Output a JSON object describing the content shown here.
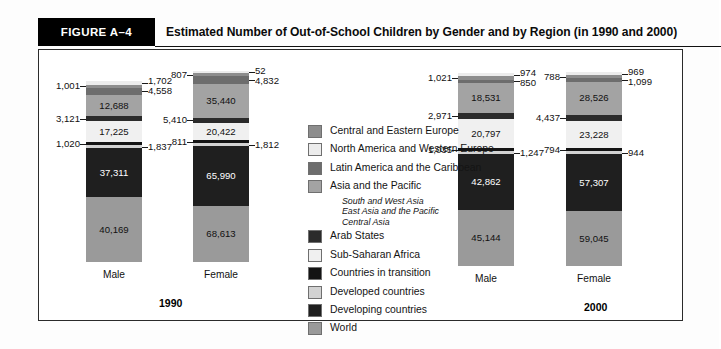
{
  "header": {
    "figure_tag": "FIGURE A–4",
    "title": "Estimated Number of Out-of-School Children by Gender and by Region (in 1990 and 2000)"
  },
  "legend": {
    "items": [
      {
        "label": "Central and Eastern Europe",
        "color": "#8d8d8d"
      },
      {
        "label": "North America and Western Europe",
        "color": "#ececec"
      },
      {
        "label": "Latin America and the Caribbean",
        "color": "#6d6d6d"
      },
      {
        "label": "Asia and the Pacific",
        "color": "#a3a3a3",
        "sub": [
          "South and West Asia",
          "East Asia and the Pacific",
          "Central Asia"
        ]
      },
      {
        "label": "Arab States",
        "color": "#2b2b2b"
      },
      {
        "label": "Sub-Saharan Africa",
        "color": "#f0f0f0"
      },
      {
        "label": "Countries in transition",
        "color": "#141414"
      },
      {
        "label": "Developed countries",
        "color": "#d2d2d2"
      },
      {
        "label": "Developing countries",
        "color": "#1f1f1f"
      },
      {
        "label": "World",
        "color": "#9a9a9a"
      }
    ]
  },
  "groups": [
    {
      "year": "1990",
      "bars": [
        {
          "gender": "Male"
        },
        {
          "gender": "Female"
        }
      ]
    },
    {
      "year": "2000",
      "bars": [
        {
          "gender": "Male"
        },
        {
          "gender": "Female"
        }
      ]
    }
  ],
  "chart_data": {
    "type": "bar",
    "title": "Estimated Number of Out-of-School Children by Gender and by Region (in 1990 and 2000)",
    "subtitle": "",
    "xlabel": "",
    "ylabel": "Number of out-of-school children (thousands)",
    "stacked": true,
    "grid": false,
    "legend_position": "center",
    "units": "thousands",
    "categories": [
      "1990 Male",
      "1990 Female",
      "2000 Male",
      "2000 Female"
    ],
    "series": [
      {
        "name": "Central and Eastern Europe",
        "color": "#8d8d8d",
        "values": [
          1001,
          807,
          1021,
          788
        ]
      },
      {
        "name": "North America and Western Europe",
        "color": "#ececec",
        "values": [
          1702,
          52,
          974,
          969
        ]
      },
      {
        "name": "Latin America and the Caribbean",
        "color": "#6d6d6d",
        "values": [
          4558,
          4832,
          850,
          1099
        ]
      },
      {
        "name": "Asia and the Pacific",
        "color": "#a3a3a3",
        "values": [
          12688,
          35440,
          18531,
          28526
        ]
      },
      {
        "name": "Arab States",
        "color": "#2b2b2b",
        "values": [
          3121,
          5410,
          2971,
          4437
        ]
      },
      {
        "name": "Sub-Saharan Africa",
        "color": "#f0f0f0",
        "values": [
          17225,
          20422,
          20797,
          23228
        ]
      },
      {
        "name": "Countries in transition",
        "color": "#141414",
        "values": [
          1020,
          811,
          1035,
          794
        ]
      },
      {
        "name": "Developed countries",
        "color": "#d2d2d2",
        "values": [
          1837,
          1812,
          1247,
          944
        ]
      },
      {
        "name": "Developing countries",
        "color": "#1f1f1f",
        "values": [
          37311,
          65990,
          42862,
          57307
        ]
      },
      {
        "name": "World",
        "color": "#9a9a9a",
        "values": [
          40169,
          68613,
          45144,
          59045
        ]
      }
    ],
    "bars": [
      {
        "group": "1990",
        "gender": "Male",
        "segments": [
          {
            "name": "North America and Western Europe",
            "value": "1,702",
            "color": "#ececec",
            "side": "right"
          },
          {
            "name": "Central and Eastern Europe",
            "value": "1,001",
            "color": "#8d8d8d",
            "side": "left"
          },
          {
            "name": "Latin America and the Caribbean",
            "value": "4,558",
            "color": "#6d6d6d",
            "side": "right"
          },
          {
            "name": "Asia and the Pacific",
            "value": "12,688",
            "color": "#a3a3a3",
            "side": "in-dark"
          },
          {
            "name": "Arab States",
            "value": "3,121",
            "color": "#2b2b2b",
            "side": "left"
          },
          {
            "name": "Sub-Saharan Africa",
            "value": "17,225",
            "color": "#f0f0f0",
            "side": "in-dark"
          },
          {
            "name": "Countries in transition",
            "value": "1,020",
            "color": "#141414",
            "side": "left"
          },
          {
            "name": "Developed countries",
            "value": "1,837",
            "color": "#d2d2d2",
            "side": "right"
          },
          {
            "name": "Developing countries",
            "value": "37,311",
            "color": "#1f1f1f",
            "side": "in-light"
          },
          {
            "name": "World",
            "value": "40,169",
            "color": "#9a9a9a",
            "side": "in-dark"
          }
        ]
      },
      {
        "group": "1990",
        "gender": "Female",
        "segments": [
          {
            "name": "North America and Western Europe",
            "value": "52",
            "color": "#ececec",
            "side": "right"
          },
          {
            "name": "Central and Eastern Europe",
            "value": "807",
            "color": "#8d8d8d",
            "side": "left"
          },
          {
            "name": "Latin America and the Caribbean",
            "value": "4,832",
            "color": "#6d6d6d",
            "side": "right"
          },
          {
            "name": "Asia and the Pacific",
            "value": "35,440",
            "color": "#a3a3a3",
            "side": "in-dark"
          },
          {
            "name": "Arab States",
            "value": "5,410",
            "color": "#2b2b2b",
            "side": "left"
          },
          {
            "name": "Sub-Saharan Africa",
            "value": "20,422",
            "color": "#f0f0f0",
            "side": "in-dark"
          },
          {
            "name": "Countries in transition",
            "value": "811",
            "color": "#141414",
            "side": "left"
          },
          {
            "name": "Developed countries",
            "value": "1,812",
            "color": "#d2d2d2",
            "side": "right"
          },
          {
            "name": "Developing countries",
            "value": "65,990",
            "color": "#1f1f1f",
            "side": "in-light"
          },
          {
            "name": "World",
            "value": "68,613",
            "color": "#9a9a9a",
            "side": "in-dark"
          }
        ]
      },
      {
        "group": "2000",
        "gender": "Male",
        "segments": [
          {
            "name": "North America and Western Europe",
            "value": "974",
            "color": "#ececec",
            "side": "right"
          },
          {
            "name": "Central and Eastern Europe",
            "value": "1,021",
            "color": "#8d8d8d",
            "side": "left"
          },
          {
            "name": "Latin America and the Caribbean",
            "value": "850",
            "color": "#6d6d6d",
            "side": "right"
          },
          {
            "name": "Asia and the Pacific",
            "value": "18,531",
            "color": "#a3a3a3",
            "side": "in-dark"
          },
          {
            "name": "Arab States",
            "value": "2,971",
            "color": "#2b2b2b",
            "side": "left"
          },
          {
            "name": "Sub-Saharan Africa",
            "value": "20,797",
            "color": "#f0f0f0",
            "side": "in-dark"
          },
          {
            "name": "Countries in transition",
            "value": "1,035",
            "color": "#141414",
            "side": "left"
          },
          {
            "name": "Developed countries",
            "value": "1,247",
            "color": "#d2d2d2",
            "side": "right"
          },
          {
            "name": "Developing countries",
            "value": "42,862",
            "color": "#1f1f1f",
            "side": "in-light"
          },
          {
            "name": "World",
            "value": "45,144",
            "color": "#9a9a9a",
            "side": "in-dark"
          }
        ]
      },
      {
        "group": "2000",
        "gender": "Female",
        "segments": [
          {
            "name": "North America and Western Europe",
            "value": "969",
            "color": "#ececec",
            "side": "right"
          },
          {
            "name": "Central and Eastern Europe",
            "value": "788",
            "color": "#8d8d8d",
            "side": "left"
          },
          {
            "name": "Latin America and the Caribbean",
            "value": "1,099",
            "color": "#6d6d6d",
            "side": "right"
          },
          {
            "name": "Asia and the Pacific",
            "value": "28,526",
            "color": "#a3a3a3",
            "side": "in-dark"
          },
          {
            "name": "Arab States",
            "value": "4,437",
            "color": "#2b2b2b",
            "side": "left"
          },
          {
            "name": "Sub-Saharan Africa",
            "value": "23,228",
            "color": "#f0f0f0",
            "side": "in-dark"
          },
          {
            "name": "Countries in transition",
            "value": "794",
            "color": "#141414",
            "side": "left"
          },
          {
            "name": "Developed countries",
            "value": "944",
            "color": "#d2d2d2",
            "side": "right"
          },
          {
            "name": "Developing countries",
            "value": "57,307",
            "color": "#1f1f1f",
            "side": "in-light"
          },
          {
            "name": "World",
            "value": "59,045",
            "color": "#9a9a9a",
            "side": "in-dark"
          }
        ]
      }
    ]
  }
}
